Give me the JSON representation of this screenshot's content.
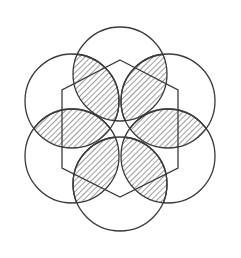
{
  "figure": {
    "type": "geometric-line-drawing",
    "background_color": "#ffffff",
    "stroke_color": "#3a3a3a",
    "hatch_color": "#3a3a3a",
    "circle_stroke_width": 1.3,
    "hexagon_stroke_width": 1.3,
    "hatch_stroke_width": 1.0,
    "hatch_spacing": 4,
    "hatch_angle_deg": 45,
    "canvas": {
      "width": 241,
      "height": 258
    },
    "center": {
      "x": 120,
      "y": 129
    },
    "circle_radius": 47,
    "center_distance": 55,
    "hexagon_radius": 59,
    "hexagon_rotation_deg": -90,
    "circles": [
      {
        "name": "circle-top",
        "cx": 120,
        "cy": 74,
        "r": 47,
        "angle_deg": -90
      },
      {
        "name": "circle-upper-right",
        "cx": 168,
        "cy": 101,
        "r": 47,
        "angle_deg": -30
      },
      {
        "name": "circle-lower-right",
        "cx": 168,
        "cy": 156,
        "r": 47,
        "angle_deg": 30
      },
      {
        "name": "circle-bottom",
        "cx": 120,
        "cy": 184,
        "r": 47,
        "angle_deg": 90
      },
      {
        "name": "circle-lower-left",
        "cx": 72,
        "cy": 156,
        "r": 47,
        "angle_deg": 150
      },
      {
        "name": "circle-upper-left",
        "cx": 72,
        "cy": 101,
        "r": 47,
        "angle_deg": -150
      }
    ],
    "hexagon_vertices": [
      {
        "name": "hex-vertex-top",
        "x": 120,
        "y": 60
      },
      {
        "name": "hex-vertex-upper-right",
        "x": 178,
        "y": 90
      },
      {
        "name": "hex-vertex-lower-right",
        "x": 178,
        "y": 168
      },
      {
        "name": "hex-vertex-bottom",
        "x": 120,
        "y": 197
      },
      {
        "name": "hex-vertex-lower-left",
        "x": 62,
        "y": 168
      },
      {
        "name": "hex-vertex-upper-left",
        "x": 62,
        "y": 90
      }
    ],
    "lenses": [
      {
        "name": "lens-top-upper-left",
        "pair": [
          "circle-top",
          "circle-upper-left"
        ],
        "hatched": true
      },
      {
        "name": "lens-top-upper-right",
        "pair": [
          "circle-top",
          "circle-upper-right"
        ],
        "hatched": true
      },
      {
        "name": "lens-left-middle",
        "pair": [
          "circle-upper-left",
          "circle-lower-left"
        ],
        "hatched": true
      },
      {
        "name": "lens-right-middle",
        "pair": [
          "circle-upper-right",
          "circle-lower-right"
        ],
        "hatched": true
      },
      {
        "name": "lens-bottom-lower-left",
        "pair": [
          "circle-lower-left",
          "circle-bottom"
        ],
        "hatched": true
      },
      {
        "name": "lens-bottom-lower-right",
        "pair": [
          "circle-lower-right",
          "circle-bottom"
        ],
        "hatched": true
      }
    ],
    "lens_count": 6,
    "circle_count": 6
  }
}
